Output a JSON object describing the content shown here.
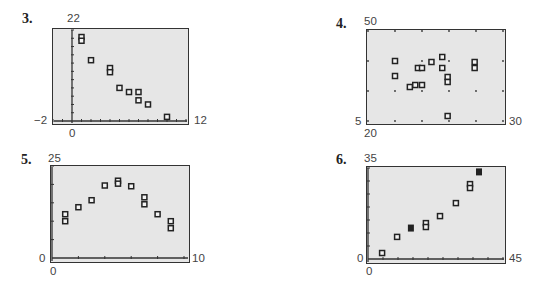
{
  "colors": {
    "frame_bg": "#e6e6e6",
    "frame_border": "#333333",
    "axis": "#333333",
    "marker": "#222222"
  },
  "chart_data": [
    {
      "id": "3",
      "type": "scatter",
      "title": "3.",
      "xlabel": "",
      "ylabel": "",
      "window": {
        "xmin": -2,
        "xmax": 12,
        "ymin": 0,
        "ymax": 22
      },
      "corner_labels": {
        "ymax": "22",
        "xmin": "-2",
        "xmax": "12",
        "origin_x": "0"
      },
      "xticks_step": 1,
      "yticks_step": 2,
      "grid": false,
      "points": [
        {
          "x": 1,
          "y": 20.3
        },
        {
          "x": 1,
          "y": 19.4
        },
        {
          "x": 2,
          "y": 14.7
        },
        {
          "x": 4,
          "y": 12.8
        },
        {
          "x": 4,
          "y": 11.8
        },
        {
          "x": 5,
          "y": 8
        },
        {
          "x": 6,
          "y": 7
        },
        {
          "x": 7,
          "y": 7
        },
        {
          "x": 7,
          "y": 5
        },
        {
          "x": 8,
          "y": 4
        },
        {
          "x": 10,
          "y": 1
        }
      ],
      "frame": {
        "left": 52,
        "top": 28,
        "width": 137,
        "height": 97,
        "plot_left": 53,
        "plot_right": 186,
        "plot_top": 30,
        "plot_bottom": 121
      }
    },
    {
      "id": "4",
      "type": "scatter",
      "title": "4.",
      "xlabel": "",
      "ylabel": "",
      "window": {
        "xmin": 20,
        "xmax": 30,
        "ymin": 5,
        "ymax": 50
      },
      "corner_labels": {
        "ymax": "50",
        "ymin": "5",
        "xmin": "20",
        "xmax": "30"
      },
      "xticks_step": 2,
      "yticks_step": 15,
      "grid": "dots",
      "points": [
        {
          "x": 22,
          "y": 35
        },
        {
          "x": 22,
          "y": 27.5
        },
        {
          "x": 23.1,
          "y": 22
        },
        {
          "x": 23.5,
          "y": 23
        },
        {
          "x": 24,
          "y": 23
        },
        {
          "x": 23.7,
          "y": 31.5
        },
        {
          "x": 24,
          "y": 31.5
        },
        {
          "x": 24.7,
          "y": 34.5
        },
        {
          "x": 25.5,
          "y": 37
        },
        {
          "x": 25.5,
          "y": 31.5
        },
        {
          "x": 25.9,
          "y": 27
        },
        {
          "x": 25.9,
          "y": 24.5
        },
        {
          "x": 25.9,
          "y": 7.5
        },
        {
          "x": 27.9,
          "y": 34.5
        },
        {
          "x": 27.9,
          "y": 31.5
        }
      ],
      "frame": {
        "left": 366,
        "top": 29,
        "width": 140,
        "height": 96,
        "plot_left": 368,
        "plot_right": 503,
        "plot_top": 31,
        "plot_bottom": 121
      }
    },
    {
      "id": "5",
      "type": "scatter",
      "title": "5.",
      "xlabel": "",
      "ylabel": "",
      "window": {
        "xmin": 0,
        "xmax": 10,
        "ymin": 0,
        "ymax": 25
      },
      "corner_labels": {
        "ymax": "25",
        "ymin": "0",
        "xmin": "0",
        "xmax": "10"
      },
      "xticks_step": 2,
      "yticks_step": 5,
      "grid": false,
      "points": [
        {
          "x": 1,
          "y": 11.9
        },
        {
          "x": 1,
          "y": 10
        },
        {
          "x": 2,
          "y": 13.8
        },
        {
          "x": 3,
          "y": 15.7
        },
        {
          "x": 4,
          "y": 19.7
        },
        {
          "x": 5,
          "y": 21
        },
        {
          "x": 5,
          "y": 20.2
        },
        {
          "x": 6,
          "y": 19.5
        },
        {
          "x": 7,
          "y": 16.5
        },
        {
          "x": 7,
          "y": 14.6
        },
        {
          "x": 8,
          "y": 11.9
        },
        {
          "x": 9,
          "y": 10
        },
        {
          "x": 9,
          "y": 8.1
        }
      ],
      "frame": {
        "left": 50,
        "top": 165,
        "width": 140,
        "height": 98,
        "plot_left": 52,
        "plot_right": 184,
        "plot_top": 166,
        "plot_bottom": 258
      }
    },
    {
      "id": "6",
      "type": "scatter",
      "title": "6.",
      "xlabel": "",
      "ylabel": "",
      "window": {
        "xmin": 0,
        "xmax": 45,
        "ymin": 0,
        "ymax": 35
      },
      "corner_labels": {
        "ymax": "35",
        "ymin": "0",
        "xmin": "0",
        "xmax": "45"
      },
      "xticks_step": 5,
      "yticks_step": 5,
      "grid": false,
      "points": [
        {
          "x": 4.7,
          "y": 2.3
        },
        {
          "x": 9.7,
          "y": 8.5
        },
        {
          "x": 14.3,
          "y": 11.9,
          "filled": true
        },
        {
          "x": 19.3,
          "y": 13.8
        },
        {
          "x": 19.3,
          "y": 12.3
        },
        {
          "x": 24,
          "y": 16.5
        },
        {
          "x": 29.3,
          "y": 21.5
        },
        {
          "x": 34,
          "y": 28.8
        },
        {
          "x": 34,
          "y": 27.3
        },
        {
          "x": 37,
          "y": 33.5,
          "filled": true
        }
      ],
      "frame": {
        "left": 366,
        "top": 166,
        "width": 140,
        "height": 98,
        "plot_left": 368,
        "plot_right": 503,
        "plot_top": 168,
        "plot_bottom": 259
      }
    }
  ],
  "panels": [
    {
      "number": "3.",
      "ymax": "22",
      "xmin": "−2",
      "xmax": "12",
      "origin": "0"
    },
    {
      "number": "4.",
      "ymax": "50",
      "ymin": "5",
      "xmin": "20",
      "xmax": "30"
    },
    {
      "number": "5.",
      "ymax": "25",
      "ymin": "0",
      "xmin": "0",
      "xmax": "10"
    },
    {
      "number": "6.",
      "ymax": "35",
      "ymin": "0",
      "xmin": "0",
      "xmax": "45"
    }
  ]
}
